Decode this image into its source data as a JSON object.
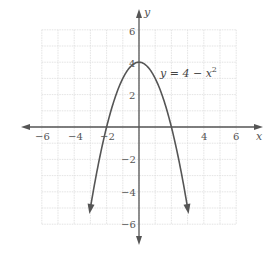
{
  "chart_data": {
    "type": "line",
    "title": "",
    "xlabel": "x",
    "ylabel": "y",
    "xlim": [
      -6,
      6
    ],
    "ylim": [
      -6,
      6
    ],
    "grid": true,
    "x_ticks": [
      "−6",
      "−4",
      "−2",
      "4",
      "6"
    ],
    "y_ticks": [
      "6",
      "4",
      "2",
      "−2",
      "−4",
      "−6"
    ],
    "annotation": {
      "label": "y = 4 − x",
      "superscript": "2"
    },
    "series": [
      {
        "name": "y = 4 − x^2",
        "function": "4 - x^2",
        "x": [
          -3,
          -2.5,
          -2,
          -1.5,
          -1,
          -0.5,
          0,
          0.5,
          1,
          1.5,
          2,
          2.5,
          3
        ],
        "y": [
          -5,
          -2.25,
          0,
          1.75,
          3,
          3.75,
          4,
          3.75,
          3,
          1.75,
          0,
          -2.25,
          -5
        ]
      }
    ]
  },
  "colors": {
    "grid": "#dcdcdc",
    "axis": "#555555",
    "curve": "#555555"
  }
}
